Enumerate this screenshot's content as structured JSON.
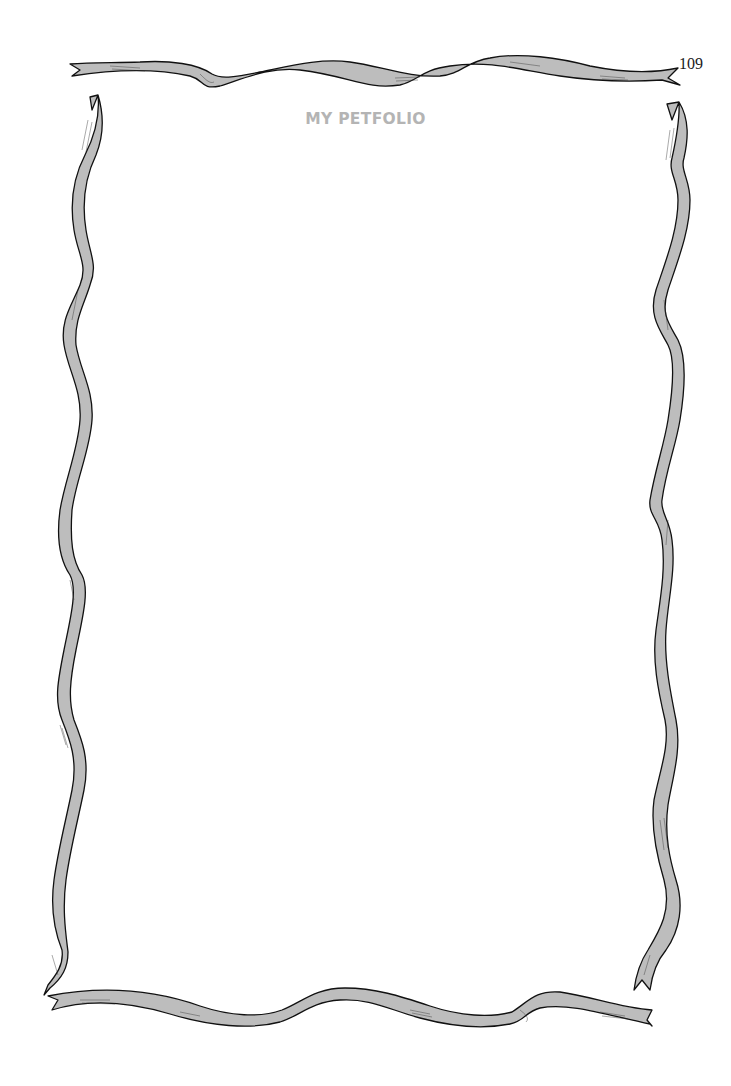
{
  "page": {
    "number": "109",
    "title": "MY PETFOLIO"
  },
  "frame": {
    "style": "wavy-ribbon-border",
    "ribbon_fill": "#bdbdbd",
    "outline": "#111111",
    "title_color": "#b4b4b4"
  },
  "content": {
    "body": ""
  }
}
